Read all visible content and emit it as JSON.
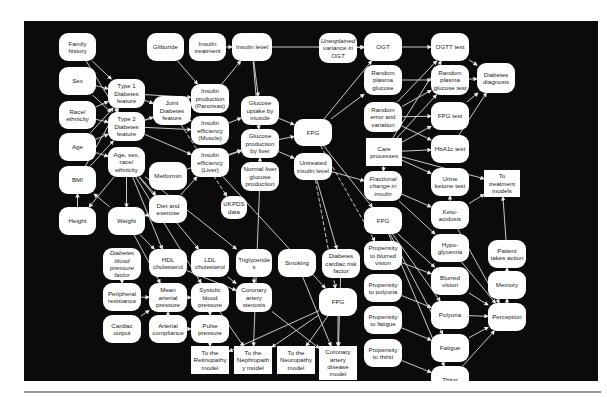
{
  "diagram": {
    "title": "",
    "nodes": [
      {
        "id": "family_history",
        "label": "Family\nhistory",
        "x": 35,
        "y": 12,
        "w": 37,
        "h": 28
      },
      {
        "id": "sex",
        "label": "Sex",
        "x": 35,
        "y": 46,
        "w": 37,
        "h": 28
      },
      {
        "id": "race",
        "label": "Race/\nethnicity",
        "x": 35,
        "y": 80,
        "w": 37,
        "h": 28
      },
      {
        "id": "age",
        "label": "Age",
        "x": 35,
        "y": 112,
        "w": 37,
        "h": 28
      },
      {
        "id": "bmi",
        "label": "BMI",
        "x": 35,
        "y": 145,
        "w": 37,
        "h": 28
      },
      {
        "id": "height",
        "label": "Height",
        "x": 35,
        "y": 186,
        "w": 37,
        "h": 28
      },
      {
        "id": "glibur",
        "label": "Gliburide",
        "x": 123,
        "y": 12,
        "w": 37,
        "h": 28
      },
      {
        "id": "insulin_treatment",
        "label": "Insulin\ntreatment",
        "x": 165,
        "y": 12,
        "w": 37,
        "h": 28
      },
      {
        "id": "insulin_level",
        "label": "Insulin level",
        "x": 208,
        "y": 12,
        "w": 40,
        "h": 28
      },
      {
        "id": "t1",
        "label": "Type 1\nDiabetes\nfeature",
        "x": 84,
        "y": 58,
        "w": 37,
        "h": 29
      },
      {
        "id": "t2",
        "label": "Type 2\nDiabetes\nfeature",
        "x": 84,
        "y": 91,
        "w": 37,
        "h": 29
      },
      {
        "id": "joint",
        "label": "Joint\nDiabetes\nfeature",
        "x": 129,
        "y": 75,
        "w": 38,
        "h": 29
      },
      {
        "id": "age_sex",
        "label": "Age, sex,\nrace/\nethnicity",
        "x": 84,
        "y": 126,
        "w": 37,
        "h": 30
      },
      {
        "id": "weight",
        "label": "Weight",
        "x": 84,
        "y": 186,
        "w": 37,
        "h": 28
      },
      {
        "id": "metformin",
        "label": "Metformin",
        "x": 125,
        "y": 141,
        "w": 38,
        "h": 28
      },
      {
        "id": "diet",
        "label": "Diet and\nexercise",
        "x": 125,
        "y": 174,
        "w": 38,
        "h": 28
      },
      {
        "id": "ins_prod",
        "label": "Insulin\nproduction\n(Pancreas)",
        "x": 167,
        "y": 63,
        "w": 38,
        "h": 29
      },
      {
        "id": "ins_eff_m",
        "label": "Insulin\nefficiency\n(Muscle)",
        "x": 167,
        "y": 95,
        "w": 38,
        "h": 29
      },
      {
        "id": "ins_eff_l",
        "label": "Insulin\nefficiency\n(Liver)",
        "x": 167,
        "y": 127,
        "w": 38,
        "h": 29
      },
      {
        "id": "gluc_up",
        "label": "Glucose\nuptake by\nmuscle",
        "x": 217,
        "y": 75,
        "w": 38,
        "h": 29
      },
      {
        "id": "gluc_prod",
        "label": "Glucose\nproduction\nby liver",
        "x": 217,
        "y": 108,
        "w": 38,
        "h": 29
      },
      {
        "id": "normal_liver",
        "label": "Normal liver\nglucose\nproduction",
        "x": 217,
        "y": 141,
        "w": 38,
        "h": 29
      },
      {
        "id": "ukpds",
        "label": "UKPDS\ndata",
        "x": 197,
        "y": 175,
        "w": 26,
        "h": 23
      },
      {
        "id": "unexp",
        "label": "Unexplained\nvariance in\nOGT",
        "x": 295,
        "y": 12,
        "w": 38,
        "h": 30,
        "italic": true
      },
      {
        "id": "fpg1",
        "label": "FPG",
        "x": 270,
        "y": 98,
        "w": 38,
        "h": 27
      },
      {
        "id": "untreated",
        "label": "Untreated\ninsulin level",
        "x": 270,
        "y": 132,
        "w": 38,
        "h": 27
      },
      {
        "id": "ogt",
        "label": "OGT",
        "x": 340,
        "y": 12,
        "w": 38,
        "h": 28
      },
      {
        "id": "rand_plasma",
        "label": "Random\nplasma\nglucose",
        "x": 340,
        "y": 44,
        "w": 38,
        "h": 30
      },
      {
        "id": "rand_err",
        "label": "Random\nerror and\nvariation",
        "x": 340,
        "y": 81,
        "w": 38,
        "h": 30
      },
      {
        "id": "care",
        "label": "Care\nprocesses",
        "x": 342,
        "y": 117,
        "w": 36,
        "h": 28,
        "rect": true
      },
      {
        "id": "frac",
        "label": "Fractional\nchange in\ninsulin",
        "x": 340,
        "y": 150,
        "w": 38,
        "h": 30,
        "italic": true
      },
      {
        "id": "fpg2",
        "label": "FPG",
        "x": 340,
        "y": 186,
        "w": 38,
        "h": 27
      },
      {
        "id": "prop_blur",
        "label": "Propensity\nto blurred\nvision",
        "x": 340,
        "y": 220,
        "w": 38,
        "h": 29
      },
      {
        "id": "prop_poly",
        "label": "Propensity\nto polyuria",
        "x": 340,
        "y": 253,
        "w": 38,
        "h": 28
      },
      {
        "id": "prop_fat",
        "label": "Propensity\nto fatigue",
        "x": 340,
        "y": 285,
        "w": 38,
        "h": 28
      },
      {
        "id": "prop_thirst",
        "label": "Propensity\nto thirst",
        "x": 340,
        "y": 318,
        "w": 38,
        "h": 28
      },
      {
        "id": "ogtt",
        "label": "OGTT test",
        "x": 407,
        "y": 12,
        "w": 38,
        "h": 28
      },
      {
        "id": "rand_test",
        "label": "Random\nplasma\nglucose test",
        "x": 407,
        "y": 44,
        "w": 38,
        "h": 30
      },
      {
        "id": "fpg_test",
        "label": "FPG test",
        "x": 407,
        "y": 81,
        "w": 38,
        "h": 28
      },
      {
        "id": "hba1c",
        "label": "HbA1c test",
        "x": 407,
        "y": 114,
        "w": 38,
        "h": 28
      },
      {
        "id": "urine",
        "label": "Urine\nketone test",
        "x": 407,
        "y": 147,
        "w": 38,
        "h": 28
      },
      {
        "id": "keto",
        "label": "Keto-\nacidosis",
        "x": 407,
        "y": 180,
        "w": 38,
        "h": 28
      },
      {
        "id": "hypo",
        "label": "Hypo-\nglycemia",
        "x": 407,
        "y": 213,
        "w": 38,
        "h": 28
      },
      {
        "id": "blurred",
        "label": "Blurred\nvision",
        "x": 407,
        "y": 246,
        "w": 38,
        "h": 28
      },
      {
        "id": "polyuria",
        "label": "Polyuria",
        "x": 407,
        "y": 280,
        "w": 38,
        "h": 28
      },
      {
        "id": "fatigue",
        "label": "Fatigue",
        "x": 407,
        "y": 313,
        "w": 38,
        "h": 28
      },
      {
        "id": "thirst",
        "label": "Thirst",
        "x": 407,
        "y": 345,
        "w": 38,
        "h": 28
      },
      {
        "id": "diab_dx",
        "label": "Diabetes\ndiagnosis",
        "x": 453,
        "y": 42,
        "w": 38,
        "h": 30
      },
      {
        "id": "to_treat",
        "label": "To\ntreatment\nmodels",
        "x": 460,
        "y": 149,
        "w": 36,
        "h": 27,
        "rect": true
      },
      {
        "id": "patient",
        "label": "Patient\ntakes action",
        "x": 464,
        "y": 219,
        "w": 38,
        "h": 28
      },
      {
        "id": "memory",
        "label": "Memory",
        "x": 464,
        "y": 250,
        "w": 38,
        "h": 28
      },
      {
        "id": "perception",
        "label": "Perception",
        "x": 464,
        "y": 282,
        "w": 38,
        "h": 28
      },
      {
        "id": "dbp",
        "label": "Diabetes\nblood\npressure\nfactor",
        "x": 79,
        "y": 227,
        "w": 38,
        "h": 32,
        "italic": true
      },
      {
        "id": "periph",
        "label": "Peripheral\nresistance",
        "x": 79,
        "y": 262,
        "w": 38,
        "h": 28
      },
      {
        "id": "cardiac",
        "label": "Cardiac\noutput",
        "x": 79,
        "y": 294,
        "w": 38,
        "h": 28
      },
      {
        "id": "hdl",
        "label": "HDL\ncholesterol",
        "x": 125,
        "y": 228,
        "w": 38,
        "h": 28
      },
      {
        "id": "map",
        "label": "Mean\narterial\npressure",
        "x": 125,
        "y": 262,
        "w": 38,
        "h": 29
      },
      {
        "id": "art_comp",
        "label": "Arterial\ncompliance",
        "x": 125,
        "y": 294,
        "w": 38,
        "h": 28
      },
      {
        "id": "ldl",
        "label": "LDL\ncholesterol",
        "x": 167,
        "y": 228,
        "w": 38,
        "h": 28
      },
      {
        "id": "sbp",
        "label": "Systolic\nblood\npressure",
        "x": 167,
        "y": 262,
        "w": 38,
        "h": 29
      },
      {
        "id": "pulse",
        "label": "Pulse\npressure",
        "x": 167,
        "y": 294,
        "w": 38,
        "h": 28
      },
      {
        "id": "trig",
        "label": "Triglyceride\ns",
        "x": 212,
        "y": 228,
        "w": 36,
        "h": 28
      },
      {
        "id": "coronary_sten",
        "label": "Coronary\nartery\nstenosis",
        "x": 212,
        "y": 262,
        "w": 36,
        "h": 29
      },
      {
        "id": "smoking",
        "label": "Smoking",
        "x": 254,
        "y": 228,
        "w": 38,
        "h": 28
      },
      {
        "id": "dcr",
        "label": "Diabetes\ncardiac risk\nfactor",
        "x": 298,
        "y": 228,
        "w": 38,
        "h": 29
      },
      {
        "id": "fpg3",
        "label": "FPG",
        "x": 295,
        "y": 267,
        "w": 38,
        "h": 28
      },
      {
        "id": "to_retino",
        "label": "To the\nRetinopathy\nmodel",
        "x": 167,
        "y": 325,
        "w": 38,
        "h": 28,
        "rect": true
      },
      {
        "id": "to_nephro",
        "label": "To the\nNephropath\ny model",
        "x": 210,
        "y": 325,
        "w": 38,
        "h": 28,
        "rect": true
      },
      {
        "id": "to_neuro",
        "label": "To the\nNeuropathy\nmodel",
        "x": 253,
        "y": 325,
        "w": 38,
        "h": 28,
        "rect": true
      },
      {
        "id": "to_cad",
        "label": "Coronary\nartery\ndisease\nmodel",
        "x": 295,
        "y": 325,
        "w": 38,
        "h": 34,
        "rect": true
      }
    ],
    "edges": [
      [
        "family_history",
        "t1"
      ],
      [
        "family_history",
        "t2"
      ],
      [
        "sex",
        "t1"
      ],
      [
        "sex",
        "t2"
      ],
      [
        "race",
        "t1"
      ],
      [
        "race",
        "t2"
      ],
      [
        "age",
        "t1"
      ],
      [
        "age",
        "t2"
      ],
      [
        "bmi",
        "t2"
      ],
      [
        "bmi",
        "t1"
      ],
      [
        "age",
        "age_sex"
      ],
      [
        "height",
        "bmi"
      ],
      [
        "weight",
        "bmi"
      ],
      [
        "t1",
        "joint"
      ],
      [
        "t2",
        "joint"
      ],
      [
        "t1",
        "ins_prod"
      ],
      [
        "t2",
        "ins_prod"
      ],
      [
        "t2",
        "ins_eff_m"
      ],
      [
        "t2",
        "ins_eff_l"
      ],
      [
        "joint",
        "ins_prod"
      ],
      [
        "joint",
        "ins_eff_m"
      ],
      [
        "glibur",
        "ins_prod"
      ],
      [
        "insulin_treatment",
        "insulin_level"
      ],
      [
        "ins_prod",
        "insulin_level"
      ],
      [
        "insulin_level",
        "gluc_up"
      ],
      [
        "insulin_level",
        "gluc_prod"
      ],
      [
        "ins_eff_m",
        "gluc_up"
      ],
      [
        "ins_eff_l",
        "gluc_prod"
      ],
      [
        "gluc_up",
        "fpg1"
      ],
      [
        "gluc_prod",
        "fpg1"
      ],
      [
        "normal_liver",
        "gluc_prod"
      ],
      [
        "gluc_prod",
        "untreated"
      ],
      [
        "fpg1",
        "ogt"
      ],
      [
        "fpg1",
        "rand_plasma"
      ],
      [
        "fpg1",
        "fpg2"
      ],
      [
        "unexp",
        "ogt"
      ],
      [
        "insulin_level",
        "ogt"
      ],
      [
        "untreated",
        "frac"
      ],
      [
        "care",
        "frac"
      ],
      [
        "ogt",
        "ogtt"
      ],
      [
        "rand_plasma",
        "rand_test"
      ],
      [
        "rand_err",
        "ogtt"
      ],
      [
        "rand_err",
        "rand_test"
      ],
      [
        "rand_err",
        "fpg_test"
      ],
      [
        "rand_err",
        "hba1c"
      ],
      [
        "care",
        "ogtt"
      ],
      [
        "care",
        "rand_test"
      ],
      [
        "care",
        "fpg_test"
      ],
      [
        "care",
        "hba1c"
      ],
      [
        "care",
        "urine"
      ],
      [
        "care",
        "to_treat"
      ],
      [
        "ogtt",
        "diab_dx"
      ],
      [
        "rand_test",
        "diab_dx"
      ],
      [
        "fpg_test",
        "diab_dx"
      ],
      [
        "hba1c",
        "diab_dx"
      ],
      [
        "frac",
        "keto"
      ],
      [
        "frac",
        "hypo"
      ],
      [
        "keto",
        "urine"
      ],
      [
        "fpg2",
        "blurred"
      ],
      [
        "fpg2",
        "polyuria"
      ],
      [
        "fpg2",
        "fatigue"
      ],
      [
        "fpg2",
        "thirst"
      ],
      [
        "prop_blur",
        "blurred"
      ],
      [
        "prop_poly",
        "polyuria"
      ],
      [
        "prop_fat",
        "fatigue"
      ],
      [
        "prop_thirst",
        "thirst"
      ],
      [
        "blurred",
        "perception"
      ],
      [
        "polyuria",
        "perception"
      ],
      [
        "fatigue",
        "perception"
      ],
      [
        "thirst",
        "perception"
      ],
      [
        "keto",
        "perception"
      ],
      [
        "hypo",
        "perception"
      ],
      [
        "perception",
        "memory"
      ],
      [
        "memory",
        "patient"
      ],
      [
        "patient",
        "to_treat"
      ],
      [
        "keto",
        "to_treat"
      ],
      [
        "age_sex",
        "weight"
      ],
      [
        "age_sex",
        "height"
      ],
      [
        "age_sex",
        "diet"
      ],
      [
        "age_sex",
        "hdl"
      ],
      [
        "age_sex",
        "ldl"
      ],
      [
        "age_sex",
        "trig"
      ],
      [
        "age_sex",
        "sbp"
      ],
      [
        "weight",
        "hdl"
      ],
      [
        "weight",
        "map"
      ],
      [
        "metformin",
        "gluc_prod"
      ],
      [
        "diet",
        "weight"
      ],
      [
        "diet",
        "ins_eff_l"
      ],
      [
        "dbp",
        "periph"
      ],
      [
        "periph",
        "map"
      ],
      [
        "cardiac",
        "map"
      ],
      [
        "map",
        "sbp"
      ],
      [
        "art_comp",
        "pulse"
      ],
      [
        "art_comp",
        "map"
      ],
      [
        "sbp",
        "pulse"
      ],
      [
        "hdl",
        "coronary_sten"
      ],
      [
        "ldl",
        "coronary_sten"
      ],
      [
        "trig",
        "coronary_sten"
      ],
      [
        "smoking",
        "to_cad"
      ],
      [
        "dcr",
        "to_cad"
      ],
      [
        "coronary_sten",
        "to_cad"
      ],
      [
        "sbp",
        "to_retino"
      ],
      [
        "fpg3",
        "to_retino"
      ],
      [
        "fpg3",
        "to_nephro"
      ],
      [
        "fpg3",
        "to_neuro"
      ],
      [
        "fpg3",
        "to_cad"
      ],
      [
        "sbp",
        "to_nephro"
      ],
      [
        "untreated",
        "dcr"
      ],
      [
        "ins_eff_l",
        "fpg3"
      ],
      [
        "normal_liver",
        "to_nephro"
      ]
    ],
    "dashed_edges": [
      [
        "untreated",
        "fpg3"
      ],
      [
        "fpg1",
        "prop_blur"
      ],
      [
        "joint",
        "ukpds"
      ]
    ]
  }
}
